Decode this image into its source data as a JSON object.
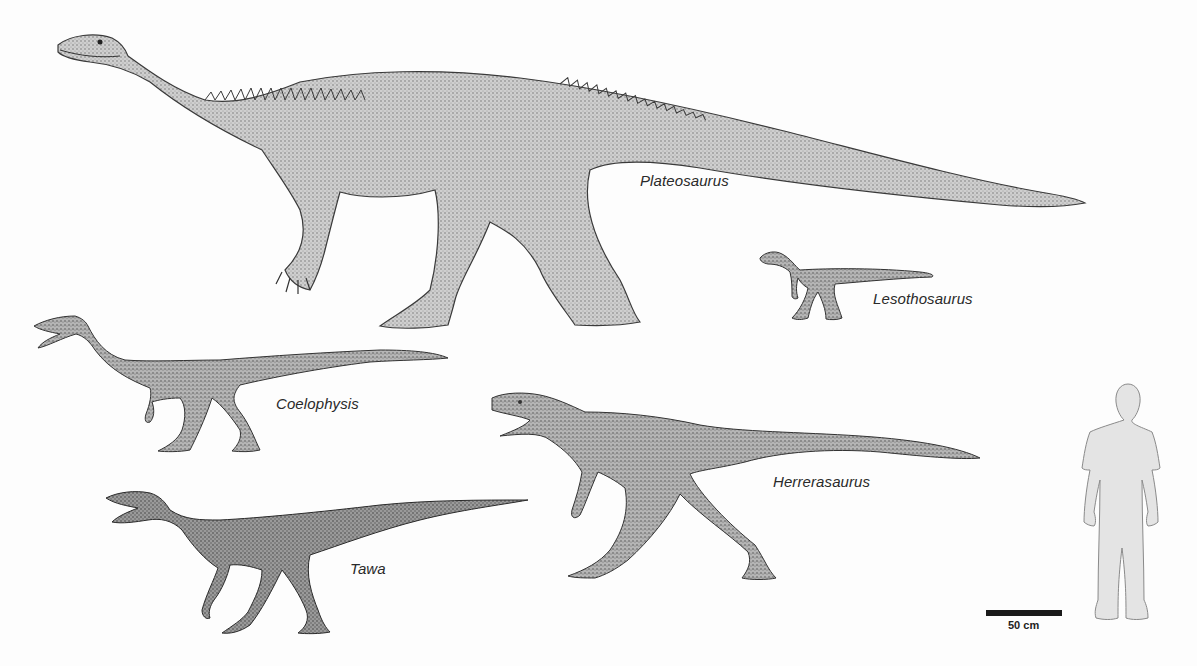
{
  "figure": {
    "type": "size-comparison",
    "background": "#fdfdfd",
    "ink_color": "#3a3a3a",
    "human_fill": "#e4e4e4"
  },
  "animals": [
    {
      "name": "Plateosaurus",
      "label_pos": [
        640,
        172
      ]
    },
    {
      "name": "Lesothosaurus",
      "label_pos": [
        873,
        290
      ]
    },
    {
      "name": "Coelophysis",
      "label_pos": [
        276,
        395
      ]
    },
    {
      "name": "Herrerasaurus",
      "label_pos": [
        773,
        473
      ]
    },
    {
      "name": "Tawa",
      "label_pos": [
        350,
        560
      ]
    }
  ],
  "human": {
    "label": "human silhouette (scale reference)"
  },
  "scale_bar": {
    "label": "50 cm",
    "length_px": 76
  }
}
